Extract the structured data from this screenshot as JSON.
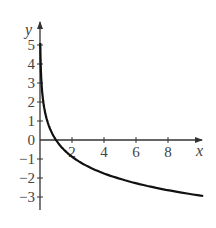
{
  "chart_data": {
    "type": "line",
    "title": "",
    "xlabel": "x",
    "ylabel": "y",
    "xlim": [
      0,
      10.2
    ],
    "ylim": [
      -3.7,
      6
    ],
    "x_ticks": [
      2,
      4,
      6,
      8
    ],
    "y_ticks": [
      5,
      4,
      3,
      2,
      1,
      0,
      -1,
      -2,
      -3
    ],
    "grid": false,
    "legend": null,
    "series": [
      {
        "name": "curve",
        "description": "decreasing logarithmic curve, vertical asymptote at x=0, x-intercept at x=1",
        "x": [
          0.02,
          0.05,
          0.1,
          0.2,
          0.3,
          0.5,
          0.75,
          1,
          1.5,
          2,
          3,
          4,
          5,
          6,
          7,
          8,
          9,
          10.2
        ],
        "y": [
          4.97,
          3.8,
          2.92,
          2.04,
          1.53,
          0.88,
          0.37,
          0,
          -0.51,
          -0.88,
          -1.4,
          -1.76,
          -2.04,
          -2.28,
          -2.47,
          -2.64,
          -2.79,
          -2.95
        ]
      }
    ]
  },
  "axes": {
    "x_label": "x",
    "y_label": "y",
    "x_tick_labels": [
      "2",
      "4",
      "6",
      "8"
    ],
    "y_tick_labels": [
      "5",
      "4",
      "3",
      "2",
      "1",
      "0",
      "−1",
      "−2",
      "−3"
    ]
  },
  "colors": {
    "curve": "#111111",
    "axis": "#333333",
    "text": "#444444"
  }
}
